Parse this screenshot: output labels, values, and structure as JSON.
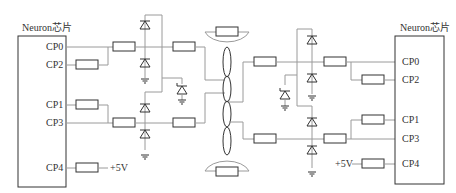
{
  "left_chip": {
    "title": "Neuron芯片",
    "pins": {
      "cp0": "CP0",
      "cp2": "CP2",
      "cp1": "CP1",
      "cp3": "CP3",
      "cp4": "CP4"
    },
    "supply": "+5V"
  },
  "right_chip": {
    "title": "Neuron芯片",
    "pins": {
      "cp0": "CP0",
      "cp2": "CP2",
      "cp1": "CP1",
      "cp3": "CP3",
      "cp4": "CP4"
    },
    "supply": "+5V"
  },
  "colors": {
    "wire": "#9a9a9a",
    "component": "#333333"
  }
}
